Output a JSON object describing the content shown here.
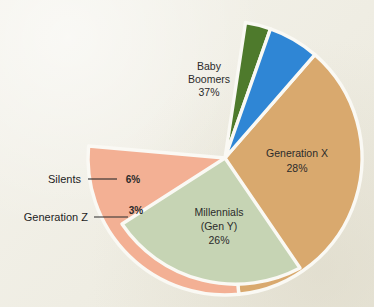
{
  "page": {
    "background_color": "#efede2",
    "wedge_gap_color": "#faf9f4"
  },
  "chart_data": {
    "type": "pie",
    "title": "",
    "xlabel": "",
    "ylabel": "",
    "legend_position": "none",
    "grid": false,
    "units": "percent",
    "total": 100,
    "categories": [
      "Baby Boomers",
      "Generation X",
      "Millennials (Gen Y)",
      "Generation Z",
      "Silents"
    ],
    "values": [
      37,
      28,
      26,
      3,
      6
    ],
    "slices": [
      {
        "name": "Baby Boomers",
        "label_lines": [
          "Baby",
          "Boomers"
        ],
        "value": 37,
        "value_label": "37%",
        "color": "#d9a96e",
        "label_placement": "inside",
        "label_x": 209,
        "label_y": 76
      },
      {
        "name": "Generation X",
        "label_lines": [
          "Generation X"
        ],
        "value": 28,
        "value_label": "28%",
        "color": "#f3b094",
        "label_placement": "inside",
        "label_x": 296,
        "label_y": 160
      },
      {
        "name": "Millennials (Gen Y)",
        "label_lines": [
          "Millennials",
          "(Gen Y)"
        ],
        "value": 26,
        "value_label": "26%",
        "color": "#c6d4b4",
        "label_placement": "inside",
        "label_x": 219,
        "label_y": 221
      },
      {
        "name": "Generation Z",
        "label_lines": [
          "Generation Z"
        ],
        "value": 3,
        "value_label": "3%",
        "color": "#4e7a2c",
        "label_placement": "callout-left",
        "label_x": 128,
        "label_y": 217,
        "value_x": 131,
        "value_y": 212
      },
      {
        "name": "Silents",
        "label_lines": [
          "Silents"
        ],
        "value": 6,
        "value_label": "6%",
        "color": "#2f86d5",
        "label_placement": "callout-left",
        "label_x": 80,
        "label_y": 181,
        "value_x": 123,
        "value_y": 179
      }
    ],
    "callouts": [
      {
        "name": "silents-callout",
        "text": "Silents"
      },
      {
        "name": "generation-z-callout",
        "text": "Generation Z"
      }
    ]
  }
}
